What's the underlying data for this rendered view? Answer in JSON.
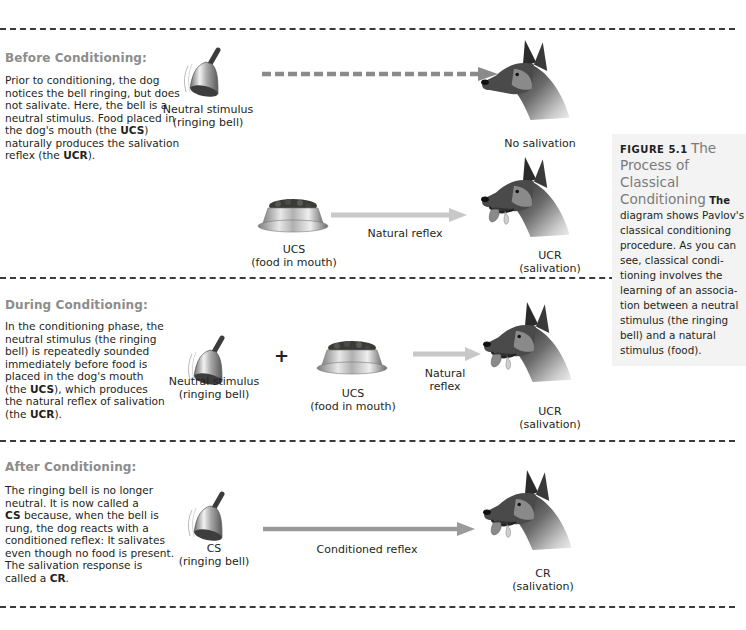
{
  "figure": {
    "number_label": "FIGURE 5.1",
    "title": "The Process of Classical Conditioning",
    "lead": "The",
    "caption": "diagram shows Pavlov's classical conditioning procedure. As you can see, classical conditioning involves the learning of an association between a neutral stimulus (the ringing bell) and a natural stimulus (food).",
    "caption_lines": [
      "diagram shows Pavlov's",
      "classical conditioning",
      "procedure. As you can",
      "see, classical condi-",
      "tioning involves the",
      "learning of an associa-",
      "tion between a neutral",
      "stimulus (the ringing",
      "bell) and a natural",
      "stimulus (food)."
    ],
    "title_lines": [
      "The",
      "Process of Classical",
      "Conditioning"
    ]
  },
  "sections": [
    {
      "heading": "Before Conditioning:",
      "description_lines": [
        {
          "parts": [
            {
              "t": "Prior to conditioning, the dog"
            }
          ]
        },
        {
          "parts": [
            {
              "t": "notices the bell ringing, but does"
            }
          ]
        },
        {
          "parts": [
            {
              "t": "not salivate. Here, the bell is a"
            }
          ]
        },
        {
          "parts": [
            {
              "t": "neutral stimulus. Food placed in"
            }
          ]
        },
        {
          "parts": [
            {
              "t": "the dog's mouth (the "
            },
            {
              "t": "UCS",
              "b": true
            },
            {
              "t": ")"
            }
          ]
        },
        {
          "parts": [
            {
              "t": "naturally produces the salivation"
            }
          ]
        },
        {
          "parts": [
            {
              "t": "reflex (the "
            },
            {
              "t": "UCR",
              "b": true
            },
            {
              "t": ")."
            }
          ]
        }
      ],
      "rows": [
        {
          "stimulus_label": [
            "Neutral stimulus",
            "(ringing bell)"
          ],
          "arrow_style": "dashed",
          "arrow_label": "",
          "response_label": [
            "No salivation"
          ]
        },
        {
          "stimulus_label": [
            "UCS",
            "(food in mouth)"
          ],
          "arrow_style": "solid-light",
          "arrow_label": "Natural reflex",
          "response_label": [
            "UCR",
            "(salivation)"
          ]
        }
      ]
    },
    {
      "heading": "During Conditioning:",
      "description_lines": [
        {
          "parts": [
            {
              "t": "In the conditioning phase, the"
            }
          ]
        },
        {
          "parts": [
            {
              "t": "neutral stimulus (the ringing"
            }
          ]
        },
        {
          "parts": [
            {
              "t": "bell) is repeatedly sounded"
            }
          ]
        },
        {
          "parts": [
            {
              "t": "immediately before food is"
            }
          ]
        },
        {
          "parts": [
            {
              "t": "placed in the dog's mouth"
            }
          ]
        },
        {
          "parts": [
            {
              "t": "(the "
            },
            {
              "t": "UCS",
              "b": true
            },
            {
              "t": "), which produces"
            }
          ]
        },
        {
          "parts": [
            {
              "t": "the natural reflex of salivation"
            }
          ]
        },
        {
          "parts": [
            {
              "t": "(the "
            },
            {
              "t": "UCR",
              "b": true
            },
            {
              "t": ")."
            }
          ]
        }
      ],
      "stimulus_label": [
        "Neutral stimulus",
        "(ringing bell)"
      ],
      "plus": "+",
      "second_stimulus_label": [
        "UCS",
        "(food in mouth)"
      ],
      "arrow_label": [
        "Natural",
        "reflex"
      ],
      "response_label": [
        "UCR",
        "(salivation)"
      ]
    },
    {
      "heading": "After Conditioning:",
      "description_lines": [
        {
          "parts": [
            {
              "t": "The ringing bell is no longer"
            }
          ]
        },
        {
          "parts": [
            {
              "t": "neutral. It is now called a"
            }
          ]
        },
        {
          "parts": [
            {
              "t": "CS",
              "b": true
            },
            {
              "t": " because, when the bell is"
            }
          ]
        },
        {
          "parts": [
            {
              "t": "rung, the dog reacts with a"
            }
          ]
        },
        {
          "parts": [
            {
              "t": "conditioned reflex: It salivates"
            }
          ]
        },
        {
          "parts": [
            {
              "t": "even though no food is present."
            }
          ]
        },
        {
          "parts": [
            {
              "t": "The salivation response is"
            }
          ]
        },
        {
          "parts": [
            {
              "t": "called a "
            },
            {
              "t": "CR",
              "b": true
            },
            {
              "t": "."
            }
          ]
        }
      ],
      "stimulus_label": [
        "CS",
        "(ringing bell)"
      ],
      "arrow_label": "Conditioned reflex",
      "response_label": [
        "CR",
        "(salivation)"
      ]
    }
  ],
  "colors": {
    "heading": "#8c8c8c",
    "text": "#231f20",
    "divider": "#3a3a3a",
    "dashed_arrow": "#8a8a8a",
    "natural_arrow": "#c8c8c8",
    "conditioned_arrow": "#9a9a9a",
    "caption_bg": "#f3f3f3",
    "caption_title": "#7a7a7a"
  }
}
